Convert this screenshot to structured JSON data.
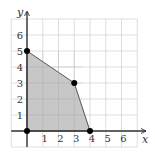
{
  "chart_data": {
    "type": "area",
    "title": "",
    "xlabel": "x",
    "ylabel": "y",
    "xlim": [
      -1,
      7
    ],
    "ylim": [
      -1,
      7
    ],
    "grid": true,
    "x_ticks": [
      1,
      2,
      3,
      4,
      5,
      6
    ],
    "y_ticks": [
      1,
      2,
      3,
      4,
      5,
      6
    ],
    "region": {
      "name": "shaded-feasible-region",
      "vertices": [
        [
          0,
          0
        ],
        [
          0,
          5
        ],
        [
          3,
          3
        ],
        [
          4,
          0
        ]
      ],
      "fill_color": "#bdbdbd"
    },
    "points": [
      {
        "x": 0,
        "y": 0
      },
      {
        "x": 0,
        "y": 5
      },
      {
        "x": 3,
        "y": 3
      },
      {
        "x": 4,
        "y": 0
      }
    ]
  },
  "colors": {
    "grid": "#d6d6d6",
    "axis": "#333333",
    "boundary": "#555555",
    "point": "#000000",
    "fill": "#bdbdbd"
  }
}
